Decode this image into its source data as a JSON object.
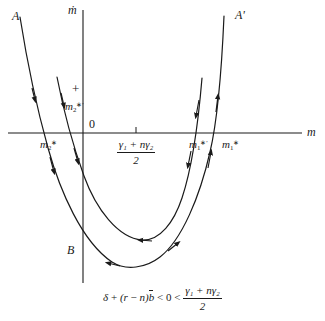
{
  "figure": {
    "type": "phase-diagram",
    "background": "#ffffff",
    "stroke_color": "#1a1a1a",
    "width": 325,
    "height": 321,
    "axes": {
      "vertical_label": "ṁ",
      "horizontal_label": "m",
      "origin_label": "0",
      "vertical_x": 83,
      "horizontal_y": 133,
      "vertical_top": 10,
      "vertical_bottom": 283,
      "horizontal_left": 8,
      "horizontal_right": 302
    },
    "labels": {
      "branch_A": "A",
      "branch_A_prime": "A'",
      "point_B": "B",
      "sign_plus": "+",
      "m2_star_prime_num": "2",
      "m2_star_num": "2",
      "m1_star_prime_num": "1",
      "m1_star_num": "1",
      "m_symbol": "m"
    },
    "midpoint_tick": {
      "x": 136,
      "numerator": "γ₁ + nγ₂",
      "denominator": "2"
    },
    "caption": {
      "lhs": "δ + (r − n)b̄",
      "rel1": "< 0 <",
      "rhs_num": "γ₁ + nγ₂",
      "rhs_den": "2",
      "full_text": "δ + (r − n)b̄ < 0 < (γ₁ + nγ₂)/2"
    },
    "curves": [
      {
        "name": "outer-parabola-A",
        "endpoint_label_left": "A",
        "endpoint_label_right": "A'",
        "x_intercept_left": 45,
        "x_intercept_right": 220,
        "vertex": [
          131,
          266
        ],
        "arrow_directions": [
          "down-left-branch",
          "right-along-bottom",
          "up-right-branch"
        ]
      },
      {
        "name": "inner-parabola",
        "x_intercept_left": 78,
        "x_intercept_right": 193,
        "vertex": [
          156,
          236
        ],
        "arrow_directions": [
          "down-left-branch",
          "left-along-bottom",
          "down-right-branch"
        ]
      }
    ]
  }
}
